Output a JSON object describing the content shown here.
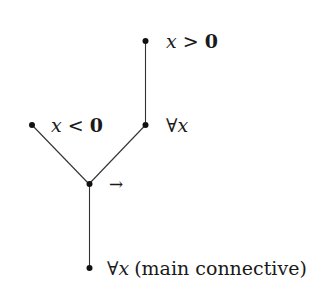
{
  "diagram": {
    "type": "parse-tree",
    "nodes": [
      {
        "id": "top",
        "label_var": "x",
        "label_op": ">",
        "label_num": "0",
        "x": 145,
        "y": 41
      },
      {
        "id": "left",
        "label_var": "x",
        "label_op": "<",
        "label_num": "0",
        "x": 32,
        "y": 125
      },
      {
        "id": "right",
        "label_quant": "∀",
        "label_var": "x",
        "x": 146,
        "y": 125
      },
      {
        "id": "junction",
        "label": "→",
        "x": 89,
        "y": 184
      },
      {
        "id": "root",
        "label_quant": "∀",
        "label_var": "x",
        "label_note": "(main connective)",
        "x": 89,
        "y": 268
      }
    ],
    "edges": [
      {
        "from": "top",
        "to": "right"
      },
      {
        "from": "left",
        "to": "junction"
      },
      {
        "from": "right",
        "to": "junction"
      },
      {
        "from": "junction",
        "to": "root"
      }
    ]
  }
}
